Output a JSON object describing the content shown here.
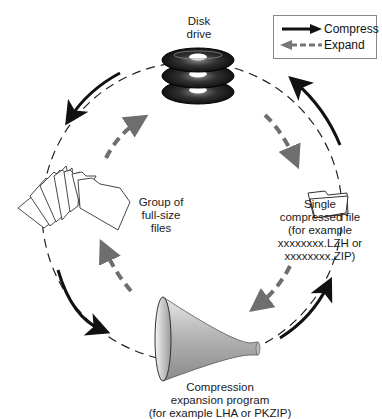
{
  "legend": {
    "compress_label": "Compress",
    "expand_label": "Expand",
    "compress_color": "#111111",
    "expand_color": "#777777"
  },
  "nodes": {
    "disk_drive": {
      "line1": "Disk",
      "line2": "drive",
      "icon": "disk-stack-icon"
    },
    "compressed_file": {
      "line1": "Single",
      "line2": "compressed file",
      "line3": "(for example",
      "line4": "xxxxxxxx.LZH or",
      "line5": "xxxxxxxx.ZIP)",
      "icon": "folder-icon"
    },
    "program": {
      "line1": "Compression",
      "line2": "expansion program",
      "line3": "(for example LHA or PKZIP)",
      "icon": "funnel-icon"
    },
    "full_files": {
      "line1": "Group of",
      "line2": "full-size",
      "line3": "files",
      "icon": "folders-fan-icon"
    }
  },
  "colors": {
    "cycle_dash": "#222222",
    "compress_arrow": "#111111",
    "expand_arrow": "#6e6e6e",
    "background": "#ffffff"
  }
}
